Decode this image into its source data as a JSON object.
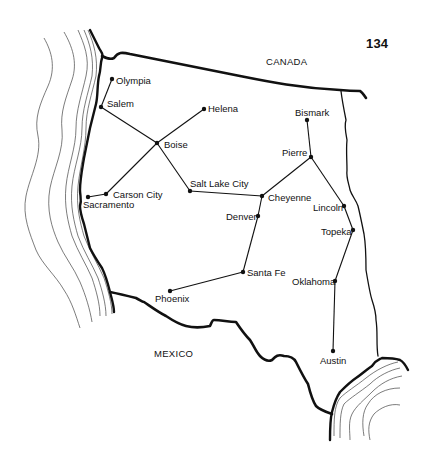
{
  "page_number": "134",
  "regions": [
    {
      "id": "canada",
      "label": "CANADA",
      "x": 266,
      "y": 56
    },
    {
      "id": "mexico",
      "label": "MEXICO",
      "x": 154,
      "y": 348
    }
  ],
  "cities": [
    {
      "id": "olympia",
      "label": "Olympia",
      "x": 112,
      "y": 79,
      "lx": 116,
      "ly": 75
    },
    {
      "id": "salem",
      "label": "Salem",
      "x": 101,
      "y": 107,
      "lx": 107,
      "ly": 98
    },
    {
      "id": "boise",
      "label": "Boise",
      "x": 157,
      "y": 143,
      "lx": 164,
      "ly": 139
    },
    {
      "id": "helena",
      "label": "Helena",
      "x": 204,
      "y": 109,
      "lx": 208,
      "ly": 103
    },
    {
      "id": "carson-city",
      "label": "Carson City",
      "x": 106,
      "y": 194,
      "lx": 113,
      "ly": 189
    },
    {
      "id": "sacramento",
      "label": "Sacramento",
      "x": 88,
      "y": 197,
      "lx": 83,
      "ly": 199
    },
    {
      "id": "salt-lake-city",
      "label": "Salt Lake City",
      "x": 190,
      "y": 191,
      "lx": 190,
      "ly": 178
    },
    {
      "id": "cheyenne",
      "label": "Cheyenne",
      "x": 262,
      "y": 196,
      "lx": 268,
      "ly": 192
    },
    {
      "id": "denver",
      "label": "Denver",
      "x": 258,
      "y": 216,
      "lx": 226,
      "ly": 211
    },
    {
      "id": "bismark",
      "label": "Bismark",
      "x": 307,
      "y": 120,
      "lx": 295,
      "ly": 107
    },
    {
      "id": "pierre",
      "label": "Pierre",
      "x": 311,
      "y": 157,
      "lx": 282,
      "ly": 147
    },
    {
      "id": "lincoln",
      "label": "Lincoln",
      "x": 344,
      "y": 206,
      "lx": 313,
      "ly": 202
    },
    {
      "id": "topeka",
      "label": "Topeka",
      "x": 353,
      "y": 230,
      "lx": 321,
      "ly": 226
    },
    {
      "id": "santa-fe",
      "label": "Santa Fe",
      "x": 243,
      "y": 272,
      "lx": 247,
      "ly": 267
    },
    {
      "id": "oklahoma",
      "label": "Oklahoma",
      "x": 335,
      "y": 281,
      "lx": 292,
      "ly": 276
    },
    {
      "id": "phoenix",
      "label": "Phoenix",
      "x": 170,
      "y": 291,
      "lx": 155,
      "ly": 293
    },
    {
      "id": "austin",
      "label": "Austin",
      "x": 333,
      "y": 351,
      "lx": 320,
      "ly": 355
    }
  ],
  "connections": [
    [
      "olympia",
      "salem"
    ],
    [
      "salem",
      "boise"
    ],
    [
      "boise",
      "helena"
    ],
    [
      "boise",
      "carson-city"
    ],
    [
      "carson-city",
      "sacramento"
    ],
    [
      "boise",
      "salt-lake-city"
    ],
    [
      "salt-lake-city",
      "cheyenne"
    ],
    [
      "cheyenne",
      "pierre"
    ],
    [
      "bismark",
      "pierre"
    ],
    [
      "pierre",
      "lincoln"
    ],
    [
      "lincoln",
      "topeka"
    ],
    [
      "cheyenne",
      "denver"
    ],
    [
      "denver",
      "santa-fe"
    ],
    [
      "santa-fe",
      "phoenix"
    ],
    [
      "topeka",
      "oklahoma"
    ],
    [
      "oklahoma",
      "austin"
    ]
  ],
  "colors": {
    "ink": "#111111",
    "contour": "#555555",
    "background": "#ffffff"
  }
}
